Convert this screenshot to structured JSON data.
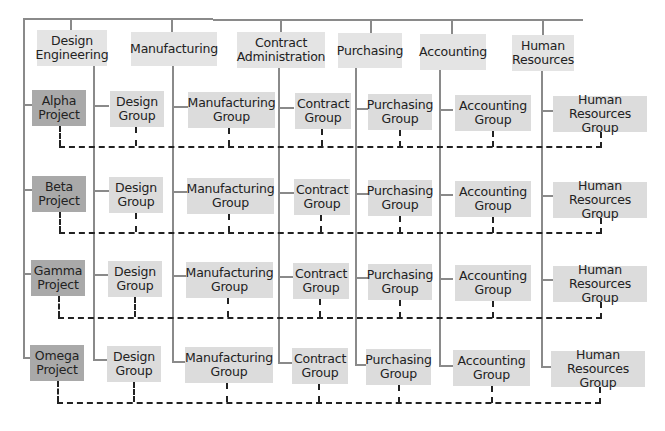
{
  "diagram": {
    "type": "matrix-organization-chart",
    "colors": {
      "department_fill": "#e4e4e4",
      "project_fill": "#a9a9a9",
      "group_fill": "#dcdcdc",
      "solid_line": "#8a8a8a",
      "dashed_line": "#222222"
    },
    "departments": [
      {
        "label": "Design\nEngineering"
      },
      {
        "label": "Manufacturing"
      },
      {
        "label": "Contract\nAdministration"
      },
      {
        "label": "Purchasing"
      },
      {
        "label": "Accounting"
      },
      {
        "label": "Human\nResources"
      }
    ],
    "projects": [
      {
        "label": "Alpha\nProject",
        "groups": [
          "Design\nGroup",
          "Manufacturing\nGroup",
          "Contract\nGroup",
          "Purchasing\nGroup",
          "Accounting\nGroup",
          "Human\nResources Group"
        ]
      },
      {
        "label": "Beta\nProject",
        "groups": [
          "Design\nGroup",
          "Manufacturing\nGroup",
          "Contract\nGroup",
          "Purchasing\nGroup",
          "Accounting\nGroup",
          "Human\nResources Group"
        ]
      },
      {
        "label": "Gamma\nProject",
        "groups": [
          "Design\nGroup",
          "Manufacturing\nGroup",
          "Contract\nGroup",
          "Purchasing\nGroup",
          "Accounting\nGroup",
          "Human\nResources Group"
        ]
      },
      {
        "label": "Omega\nProject",
        "groups": [
          "Design\nGroup",
          "Manufacturing\nGroup",
          "Contract\nGroup",
          "Purchasing\nGroup",
          "Accounting\nGroup",
          "Human\nResources Group"
        ]
      }
    ]
  }
}
